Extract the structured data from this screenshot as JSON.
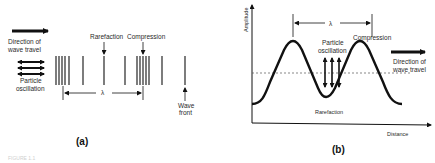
{
  "panel_a": {
    "caption": "(a)",
    "direction_label": [
      "Direction of",
      "wave travel"
    ],
    "particle_label": [
      "Particle",
      "oscillation"
    ],
    "rarefaction_label": "Rarefaction",
    "compression_label": "Compression",
    "wavelength_symbol": "λ",
    "wavefront_label": [
      "Wave",
      "front"
    ]
  },
  "panel_b": {
    "caption": "(b)",
    "y_axis_label": "Amplitude",
    "x_axis_label": "Distance",
    "wavelength_symbol": "λ",
    "particle_label": [
      "Particle",
      "oscillation"
    ],
    "compression_label": "Compression",
    "rarefaction_label": "Rarefaction",
    "direction_label": [
      "Direction of",
      "wave travel"
    ]
  },
  "footer_text": "FIGURE 1.1"
}
